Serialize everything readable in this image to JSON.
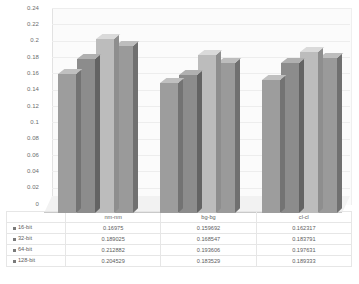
{
  "chart_data": {
    "type": "bar",
    "title": "",
    "subtitle": "",
    "xlabel": "",
    "ylabel": "",
    "categories": [
      "nm-nm",
      "bg-bg",
      "cl-cl"
    ],
    "series": [
      {
        "name": "16-bit",
        "values": [
          0.16975,
          0.159692,
          0.162317
        ]
      },
      {
        "name": "32-bit",
        "values": [
          0.189025,
          0.168547,
          0.183791
        ]
      },
      {
        "name": "64-bit",
        "values": [
          0.212882,
          0.193606,
          0.197631
        ]
      },
      {
        "name": "128-bit",
        "values": [
          0.204529,
          0.183529,
          0.189333
        ]
      }
    ],
    "ylim": [
      0,
      0.24
    ],
    "ytick_step": 0.02,
    "ytick_labels": [
      "0.24",
      "0.22",
      "0.2",
      "0.18",
      "0.16",
      "0.14",
      "0.12",
      "0.1",
      "0.08",
      "0.06",
      "0.04",
      "0.02",
      "0"
    ],
    "grid": true,
    "legend_position": "data-table",
    "data_table_visible": true,
    "three_d": true,
    "colors": {
      "series_16bit": "#9d9d9d",
      "series_32bit": "#8c8c8c",
      "series_64bit": "#bcbcbc",
      "series_128bit": "#9a9a9a",
      "plot_background": "#fbfbfb",
      "gridline": "#ededed",
      "text": "#5c5c5c"
    },
    "value_labels": {
      "row_16bit": [
        "0.16975",
        "0.159692",
        "0.162317"
      ],
      "row_32bit": [
        "0.189025",
        "0.168547",
        "0.183791"
      ],
      "row_64bit": [
        "0.212882",
        "0.193606",
        "0.197631"
      ],
      "row_128bit": [
        "0.204529",
        "0.183529",
        "0.189333"
      ]
    }
  }
}
